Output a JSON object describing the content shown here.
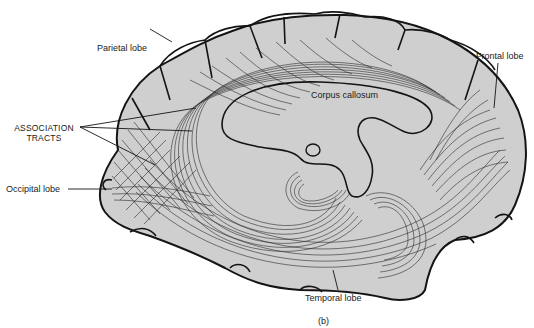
{
  "figure": {
    "panel_label": "(b)",
    "colors": {
      "brain_fill": "#cfcfcf",
      "outline": "#141414",
      "fibers": "#2a2a2a",
      "background": "#ffffff"
    }
  },
  "labels": {
    "parietal": "Parietal lobe",
    "frontal": "Frontal lobe",
    "corpus_callosum": "Corpus callosum",
    "association_line1": "ASSOCIATION",
    "association_line2": "TRACTS",
    "occipital": "Occipital lobe",
    "temporal": "Temporal lobe"
  }
}
